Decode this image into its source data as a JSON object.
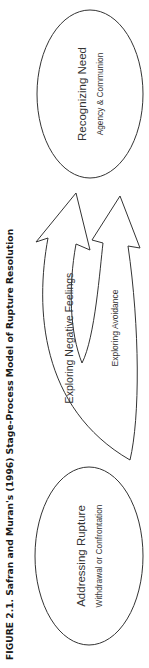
{
  "figure": {
    "title": "FIGURE 2.1.  Safran and Muran's (1996) Stage-Process Model of Rupture Resolution",
    "orientation": "rotated 90° counter-clockwise"
  },
  "nodes": [
    {
      "id": "addressing",
      "label": "Addressing Rupture",
      "sublabel": "Withdrawal or Confrontation"
    },
    {
      "id": "recognizing",
      "label": "Recognizing Need",
      "sublabel": "Agency & Communion"
    }
  ],
  "arrows": [
    {
      "id": "negative",
      "label": "Exploring Negative Feelings",
      "from": "addressing",
      "to": "recognizing"
    },
    {
      "id": "avoidance",
      "label": "Exploring Avoidance",
      "from": "negative",
      "to": "negative"
    }
  ]
}
